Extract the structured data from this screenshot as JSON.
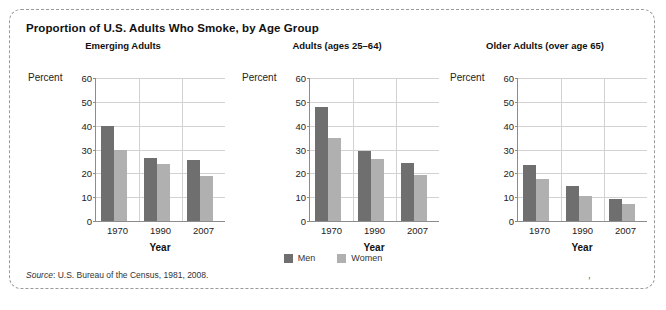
{
  "figure": {
    "title": "Proportion of U.S. Adults Who Smoke, by Age Group",
    "source": "Source: U.S. Bureau of the Census, 1981, 2008.",
    "source_word": "Source",
    "source_rest": ": U.S. Bureau of the Census, 1981, 2008.",
    "stray_mark": "′"
  },
  "legend": {
    "items": [
      {
        "label": "Men",
        "color": "#6f6f6f",
        "swatch_name": "legend-swatch-men"
      },
      {
        "label": "Women",
        "color": "#b0b0b0",
        "swatch_name": "legend-swatch-women"
      }
    ]
  },
  "axis": {
    "y_label": "Percent",
    "x_label": "Year",
    "y_ticks": [
      "60",
      "50",
      "40",
      "30",
      "20",
      "10",
      "0"
    ],
    "x_ticks": [
      "1970",
      "1990",
      "2007"
    ]
  },
  "chart_data": [
    {
      "type": "bar",
      "title": "Emerging Adults",
      "xlabel": "Year",
      "ylabel": "Percent",
      "ylim": [
        0,
        60
      ],
      "yticks": [
        0,
        10,
        20,
        30,
        40,
        50,
        60
      ],
      "grid": true,
      "legend_position": "bottom-center",
      "categories": [
        "1970",
        "1990",
        "2007"
      ],
      "series": [
        {
          "name": "Men",
          "color": "#6f6f6f",
          "values": [
            40.0,
            26.5,
            25.5
          ]
        },
        {
          "name": "Women",
          "color": "#b0b0b0",
          "values": [
            30.0,
            24.0,
            19.0
          ]
        }
      ]
    },
    {
      "type": "bar",
      "title": "Adults (ages 25–64)",
      "xlabel": "Year",
      "ylabel": "Percent",
      "ylim": [
        0,
        60
      ],
      "yticks": [
        0,
        10,
        20,
        30,
        40,
        50,
        60
      ],
      "grid": true,
      "legend_position": "bottom-center",
      "categories": [
        "1970",
        "1990",
        "2007"
      ],
      "series": [
        {
          "name": "Men",
          "color": "#6f6f6f",
          "values": [
            48.0,
            29.5,
            24.5
          ]
        },
        {
          "name": "Women",
          "color": "#b0b0b0",
          "values": [
            35.0,
            26.0,
            19.5
          ]
        }
      ]
    },
    {
      "type": "bar",
      "title": "Older Adults (over age 65)",
      "xlabel": "Year",
      "ylabel": "Percent",
      "ylim": [
        0,
        60
      ],
      "yticks": [
        0,
        10,
        20,
        30,
        40,
        50,
        60
      ],
      "grid": true,
      "legend_position": "bottom-center",
      "categories": [
        "1970",
        "1990",
        "2007"
      ],
      "series": [
        {
          "name": "Men",
          "color": "#6f6f6f",
          "values": [
            23.5,
            14.5,
            9.2
          ]
        },
        {
          "name": "Women",
          "color": "#b0b0b0",
          "values": [
            17.5,
            10.5,
            7.2
          ]
        }
      ]
    }
  ]
}
